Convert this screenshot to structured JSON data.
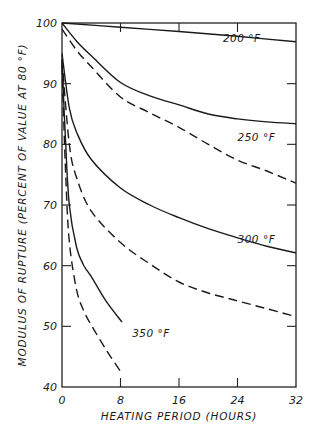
{
  "chart_data": {
    "type": "line",
    "title": "",
    "xlabel": "HEATING PERIOD (HOURS)",
    "ylabel": "MODULUS OF RUPTURE (PERCENT OF VALUE AT 80 °F)",
    "xlim": [
      0,
      32
    ],
    "ylim": [
      40,
      100
    ],
    "xticks": [
      0,
      8,
      16,
      24,
      32
    ],
    "yticks": [
      40,
      50,
      60,
      70,
      80,
      90,
      100
    ],
    "grid": false,
    "legend": "inline labels",
    "series": [
      {
        "name": "200 °F",
        "style": "solid",
        "label_pos": [
          22,
          96.9
        ],
        "x": [
          0,
          8,
          16,
          24,
          32
        ],
        "y": [
          100,
          99.3,
          98.6,
          97.8,
          96.9
        ]
      },
      {
        "name": "250 °F",
        "style": "solid",
        "label_pos": [
          24,
          80.6
        ],
        "x": [
          0,
          2,
          4,
          8,
          12,
          16,
          20,
          24,
          28,
          32
        ],
        "y": [
          100,
          97,
          94.6,
          90.2,
          88,
          86.5,
          85,
          84.2,
          83.7,
          83.4
        ]
      },
      {
        "name": "250 °F (dashed)",
        "style": "dashed",
        "x": [
          0,
          2,
          4,
          8,
          12,
          16,
          20,
          24,
          28,
          32
        ],
        "y": [
          99,
          95.5,
          92.8,
          87.8,
          85.2,
          82.8,
          80,
          77.4,
          75.6,
          73.6
        ]
      },
      {
        "name": "300 °F",
        "style": "solid",
        "label_pos": [
          24,
          63.8
        ],
        "x": [
          0,
          1,
          2,
          4,
          8,
          12,
          16,
          20,
          24,
          28,
          32
        ],
        "y": [
          95,
          86,
          82,
          77.5,
          72.8,
          70,
          67.9,
          66.1,
          64.6,
          63.2,
          62.1
        ]
      },
      {
        "name": "300 °F (dashed)",
        "style": "dashed",
        "x": [
          0,
          1,
          2,
          4,
          8,
          12,
          16,
          20,
          24,
          28,
          32
        ],
        "y": [
          94,
          80,
          74.5,
          69,
          63.8,
          60.3,
          57.3,
          55.5,
          54.2,
          52.9,
          51.6
        ]
      },
      {
        "name": "350 °F",
        "style": "solid",
        "label_pos": [
          9.6,
          48.3
        ],
        "x": [
          0,
          0.5,
          1,
          2,
          3,
          4,
          6,
          8.2
        ],
        "y": [
          94,
          80,
          70,
          63,
          60,
          58.2,
          54.2,
          50.7
        ]
      },
      {
        "name": "350 °F (dashed)",
        "style": "dashed",
        "x": [
          0,
          0.5,
          1,
          2,
          3,
          4,
          6,
          8.2
        ],
        "y": [
          93,
          75,
          64,
          56,
          52.5,
          50.2,
          46.2,
          42.2
        ]
      }
    ]
  },
  "labels": {
    "xlabel": "HEATING PERIOD (HOURS)",
    "ylabel": "MODULUS OF RUPTURE (PERCENT OF VALUE AT 80 °F)",
    "series_labels": [
      "200 °F",
      "250 °F",
      "300 °F",
      "350 °F"
    ]
  }
}
